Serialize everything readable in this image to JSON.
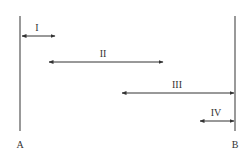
{
  "diagram": {
    "endpoints": [
      {
        "label": "A",
        "x": 20
      },
      {
        "label": "B",
        "x": 235
      }
    ],
    "segments": [
      {
        "label": "I",
        "x1": 21,
        "x2": 55,
        "y": 36
      },
      {
        "label": "II",
        "x1": 49,
        "x2": 163,
        "y": 62
      },
      {
        "label": "III",
        "x1": 122,
        "x2": 234,
        "y": 93
      },
      {
        "label": "IV",
        "x1": 200,
        "x2": 234,
        "y": 121
      }
    ],
    "colors": {
      "line": "#333333"
    }
  }
}
